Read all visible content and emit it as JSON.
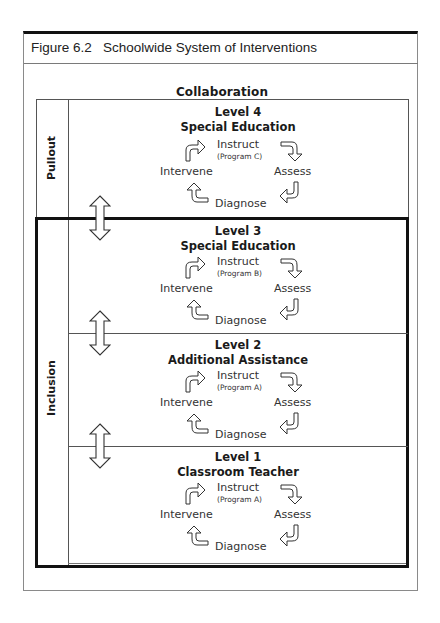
{
  "figure": {
    "title": "Figure 6.2   Schoolwide System of Interventions",
    "top_label": "Collaboration",
    "side_labels": {
      "pullout": "Pullout",
      "inclusion": "Inclusion"
    }
  },
  "levels": [
    {
      "number": "Level 4",
      "name": "Special Education",
      "instruct": "Instruct",
      "program": "(Program C)",
      "assess": "Assess",
      "diagnose": "Diagnose",
      "intervene": "Intervene"
    },
    {
      "number": "Level 3",
      "name": "Special Education",
      "instruct": "Instruct",
      "program": "(Program B)",
      "assess": "Assess",
      "diagnose": "Diagnose",
      "intervene": "Intervene"
    },
    {
      "number": "Level 2",
      "name": "Additional Assistance",
      "instruct": "Instruct",
      "program": "(Program A)",
      "assess": "Assess",
      "diagnose": "Diagnose",
      "intervene": "Intervene"
    },
    {
      "number": "Level 1",
      "name": "Classroom Teacher",
      "instruct": "Instruct",
      "program": "(Program A)",
      "assess": "Assess",
      "diagnose": "Diagnose",
      "intervene": "Intervene"
    }
  ],
  "icons": {
    "cycle_arrow": "curved-block-arrow",
    "level_transition": "double-headed-vertical-arrow"
  },
  "colors": {
    "line": "#555555",
    "thick_border": "#111111",
    "text": "#1a1a1a"
  }
}
